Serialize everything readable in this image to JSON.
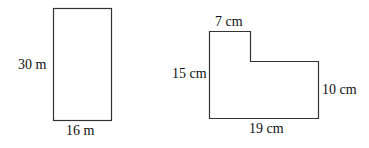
{
  "diagram": {
    "stroke_color": "#333333",
    "background": "#ffffff",
    "figures": [
      {
        "id": "rectangle",
        "shape": "rectangle",
        "labels": {
          "height": "30 m",
          "width": "16 m"
        }
      },
      {
        "id": "l-shape",
        "shape": "L-shaped polygon",
        "labels": {
          "top_width": "7 cm",
          "left_height": "15 cm",
          "right_height": "10 cm",
          "bottom_width": "19 cm"
        }
      }
    ]
  }
}
